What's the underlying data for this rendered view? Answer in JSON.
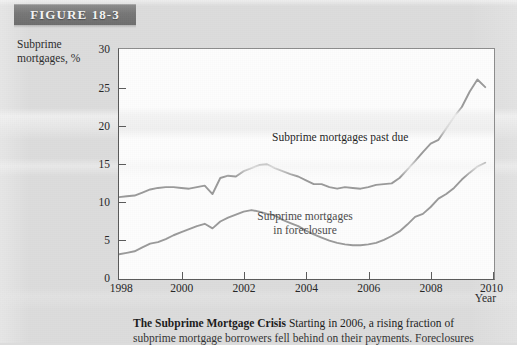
{
  "figure": {
    "banner_label": "FIGURE 18-3"
  },
  "axes": {
    "y_title_line1": "Subprime",
    "y_title_line2": "mortgages, %",
    "x_title": "Year"
  },
  "caption": {
    "bold": "The Subprime Mortgage Crisis",
    "line1": " Starting in 2006, a rising fraction of",
    "line2": "subprime mortgage borrowers fell behind on their payments. Foreclosures"
  },
  "chart_data": {
    "type": "line",
    "title": "The Subprime Mortgage Crisis",
    "xlabel": "Year",
    "ylabel": "Subprime mortgages, %",
    "xlim": [
      1998,
      2010
    ],
    "ylim": [
      0,
      30
    ],
    "xticks": [
      1998,
      2000,
      2002,
      2004,
      2006,
      2008,
      2010
    ],
    "yticks": [
      0,
      5,
      10,
      15,
      20,
      25,
      30
    ],
    "grid": false,
    "legend": "inline-annotations",
    "line_color": "#9a9a9a",
    "annotations": [
      {
        "text": "Subprime mortgages past due",
        "x": 2004.3,
        "y": 19.0
      },
      {
        "text": "Subprime mortgages in foreclosure",
        "x": 2005.6,
        "y": 10.3
      }
    ],
    "series": [
      {
        "name": "Subprime mortgages past due",
        "x": [
          1998.0,
          1998.25,
          1998.5,
          1998.75,
          1999.0,
          1999.25,
          1999.5,
          1999.75,
          2000.0,
          2000.25,
          2000.5,
          2000.75,
          2001.0,
          2001.25,
          2001.5,
          2001.75,
          2002.0,
          2002.25,
          2002.5,
          2002.75,
          2003.0,
          2003.25,
          2003.5,
          2003.75,
          2004.0,
          2004.25,
          2004.5,
          2004.75,
          2005.0,
          2005.25,
          2005.5,
          2005.75,
          2006.0,
          2006.25,
          2006.5,
          2006.75,
          2007.0,
          2007.25,
          2007.5,
          2007.75,
          2008.0,
          2008.25,
          2008.5,
          2008.75,
          2009.0,
          2009.25,
          2009.5,
          2009.75
        ],
        "y": [
          10.6,
          10.7,
          10.8,
          11.2,
          11.6,
          11.8,
          11.9,
          11.9,
          11.8,
          11.7,
          11.9,
          12.1,
          11.0,
          13.1,
          13.4,
          13.3,
          14.0,
          14.4,
          14.8,
          14.9,
          14.4,
          14.0,
          13.6,
          13.3,
          12.8,
          12.3,
          12.3,
          11.9,
          11.7,
          11.9,
          11.8,
          11.7,
          11.9,
          12.2,
          12.3,
          12.4,
          13.1,
          14.2,
          15.3,
          16.5,
          17.6,
          18.1,
          19.6,
          21.1,
          22.4,
          24.4,
          26.0,
          25.0
        ]
      },
      {
        "name": "Subprime mortgages in foreclosure",
        "x": [
          1998.0,
          1998.25,
          1998.5,
          1998.75,
          1999.0,
          1999.25,
          1999.5,
          1999.75,
          2000.0,
          2000.25,
          2000.5,
          2000.75,
          2001.0,
          2001.25,
          2001.5,
          2001.75,
          2002.0,
          2002.25,
          2002.5,
          2002.75,
          2003.0,
          2003.25,
          2003.5,
          2003.75,
          2004.0,
          2004.25,
          2004.5,
          2004.75,
          2005.0,
          2005.25,
          2005.5,
          2005.75,
          2006.0,
          2006.25,
          2006.5,
          2006.75,
          2007.0,
          2007.25,
          2007.5,
          2007.75,
          2008.0,
          2008.25,
          2008.5,
          2008.75,
          2009.0,
          2009.25,
          2009.5,
          2009.75
        ],
        "y": [
          3.1,
          3.3,
          3.5,
          4.0,
          4.5,
          4.7,
          5.1,
          5.6,
          6.0,
          6.4,
          6.8,
          7.1,
          6.5,
          7.4,
          7.9,
          8.3,
          8.7,
          8.9,
          8.7,
          8.4,
          8.2,
          7.6,
          7.2,
          6.8,
          6.2,
          5.7,
          5.3,
          4.9,
          4.6,
          4.4,
          4.3,
          4.3,
          4.4,
          4.6,
          5.0,
          5.5,
          6.1,
          7.0,
          8.0,
          8.4,
          9.3,
          10.4,
          11.0,
          11.8,
          12.9,
          13.8,
          14.6,
          15.1
        ]
      }
    ]
  }
}
